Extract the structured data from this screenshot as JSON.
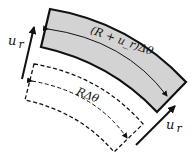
{
  "diagram": {
    "deformed_element": {
      "arc_label": "(R + u_r)Δθ",
      "fill": "#d3d3d3",
      "stroke": "#111111"
    },
    "original_element": {
      "arc_label": "RΔθ",
      "stroke": "#111111",
      "style": "dashed"
    },
    "displacement_left": {
      "label_main": "u",
      "label_sub": "r"
    },
    "displacement_right": {
      "label_main": "u",
      "label_sub": "r"
    }
  }
}
